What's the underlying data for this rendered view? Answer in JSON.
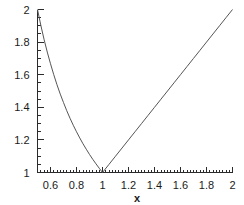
{
  "figure": {
    "background_color": "#ffffff",
    "width": 244,
    "height": 205
  },
  "chart_data": {
    "type": "line",
    "title": "",
    "subtitle": "",
    "xlabel": "x",
    "ylabel": "",
    "xlim": [
      0.5,
      2
    ],
    "ylim": [
      1,
      2
    ],
    "grid": false,
    "legend": null,
    "legend_position": "none",
    "line_color": "#555555",
    "axis_color": "#2b2b2b",
    "text_color": "#1a1a1a",
    "xticks": [
      0.6,
      0.8,
      1,
      1.2,
      1.4,
      1.6,
      1.8,
      2
    ],
    "xtick_labels": [
      "0.6",
      "0.8",
      "1",
      "1.2",
      "1.4",
      "1.6",
      "1.8",
      "2"
    ],
    "xtick_minor_step": 0.025,
    "yticks": [
      1,
      1.2,
      1.4,
      1.6,
      1.8,
      2
    ],
    "ytick_labels": [
      "1",
      "1.2",
      "1.4",
      "1.6",
      "1.8",
      "2"
    ],
    "ytick_minor_step": 0.05,
    "annotations": [],
    "series": [
      {
        "name": "max(x, 1/x)",
        "x": [
          0.5,
          0.525,
          0.55,
          0.575,
          0.6,
          0.625,
          0.65,
          0.675,
          0.7,
          0.725,
          0.75,
          0.775,
          0.8,
          0.825,
          0.85,
          0.875,
          0.9,
          0.925,
          0.95,
          0.975,
          1.0,
          1.05,
          1.1,
          1.15,
          1.2,
          1.25,
          1.3,
          1.35,
          1.4,
          1.45,
          1.5,
          1.55,
          1.6,
          1.65,
          1.7,
          1.75,
          1.8,
          1.85,
          1.9,
          1.95,
          2.0
        ],
        "y": [
          2.0,
          1.905,
          1.818,
          1.739,
          1.667,
          1.6,
          1.538,
          1.481,
          1.429,
          1.379,
          1.333,
          1.29,
          1.25,
          1.212,
          1.176,
          1.143,
          1.111,
          1.081,
          1.053,
          1.026,
          1.0,
          1.05,
          1.1,
          1.15,
          1.2,
          1.25,
          1.3,
          1.35,
          1.4,
          1.45,
          1.5,
          1.55,
          1.6,
          1.65,
          1.7,
          1.75,
          1.8,
          1.85,
          1.9,
          1.95,
          2.0
        ]
      }
    ],
    "minimum_point": {
      "x": 1,
      "y": 1
    }
  }
}
